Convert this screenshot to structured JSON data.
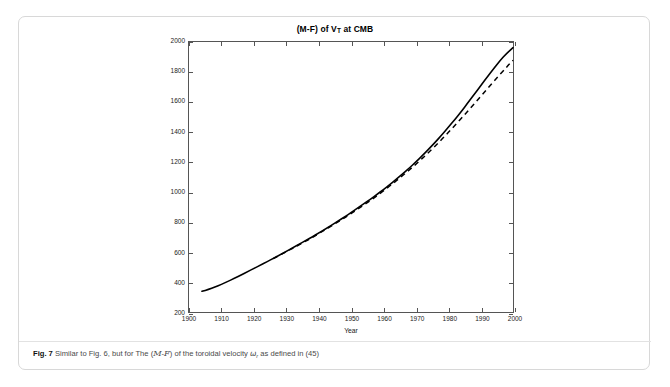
{
  "figure": {
    "label": "Fig. 7",
    "caption_before": "Similar to Fig. 6, but for The (",
    "caption_cal_m": "M",
    "caption_dash": "-",
    "caption_cal_f": "F",
    "caption_middle": ") of the toroidal velocity ",
    "caption_omega": "ω",
    "caption_omega_sub": "r",
    "caption_after": " as defined in (45)"
  },
  "chart_data": {
    "type": "line",
    "title": "(M-F) of V",
    "title_sub": "T",
    "title_tail": " at CMB",
    "xlabel": "Year",
    "ylabel": "",
    "xlim": [
      1900,
      2000
    ],
    "ylim": [
      200,
      2000
    ],
    "xticks": [
      1900,
      1910,
      1920,
      1930,
      1940,
      1950,
      1960,
      1970,
      1980,
      1990,
      2000
    ],
    "yticks": [
      200,
      400,
      600,
      800,
      1000,
      1200,
      1400,
      1600,
      1800,
      2000
    ],
    "grid": false,
    "legend": null,
    "series": [
      {
        "name": "solid",
        "style": "solid",
        "color": "#000000",
        "x": [
          1904,
          1906,
          1908,
          1910,
          1912,
          1914,
          1916,
          1918,
          1920,
          1922,
          1924,
          1926,
          1928,
          1930,
          1932,
          1934,
          1936,
          1938,
          1940,
          1942,
          1944,
          1946,
          1948,
          1950,
          1952,
          1954,
          1956,
          1958,
          1960,
          1962,
          1964,
          1966,
          1968,
          1970,
          1972,
          1974,
          1976,
          1978,
          1980,
          1982,
          1984,
          1986,
          1988,
          1990,
          1992,
          1994,
          1996,
          1998,
          2000
        ],
        "y": [
          338,
          350,
          366,
          384,
          404,
          424,
          446,
          468,
          490,
          512,
          534,
          557,
          580,
          604,
          628,
          652,
          676,
          700,
          726,
          752,
          778,
          806,
          834,
          862,
          892,
          922,
          952,
          984,
          1016,
          1050,
          1086,
          1122,
          1160,
          1200,
          1242,
          1286,
          1332,
          1380,
          1430,
          1482,
          1536,
          1592,
          1650,
          1708,
          1766,
          1822,
          1876,
          1924,
          1962
        ]
      },
      {
        "name": "dashed",
        "style": "dashed",
        "color": "#000000",
        "x": [
          1926,
          1930,
          1934,
          1938,
          1942,
          1946,
          1950,
          1954,
          1958,
          1962,
          1966,
          1970,
          1974,
          1978,
          1982,
          1986,
          1990,
          1994,
          1998,
          2000
        ],
        "y": [
          556,
          602,
          648,
          696,
          748,
          800,
          856,
          914,
          974,
          1040,
          1110,
          1184,
          1264,
          1350,
          1442,
          1538,
          1636,
          1736,
          1832,
          1878
        ]
      }
    ]
  }
}
